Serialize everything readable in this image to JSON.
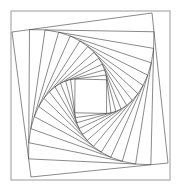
{
  "figure": {
    "type": "geometric-line-figure",
    "canvas": {
      "width": 181,
      "height": 194,
      "background": "#ffffff"
    },
    "frame": {
      "name": "outer-border-rectangle",
      "x": 11,
      "y": 11,
      "width": 159,
      "height": 169,
      "stroke": "#9a9a9a",
      "stroke_width": 1,
      "fill": "none"
    },
    "spiral": {
      "name": "whirling-squares",
      "construction": "each successive quadrilateral places its vertices at a constant fraction t along each edge of the previous quadrilateral, producing progressive rotation and shrinkage",
      "seed_quad": [
        [
          12,
          32
        ],
        [
          152,
          13
        ],
        [
          168,
          163
        ],
        [
          31,
          177
        ]
      ],
      "t_fraction": 0.125,
      "iterations": 13,
      "stroke": "#3a3a3a",
      "stroke_width": 0.6,
      "fill": "none",
      "rotation_direction": "clockwise-inward"
    }
  },
  "chart_data": {
    "type": "line",
    "xlabel": "",
    "ylabel": "",
    "xlim": [
      0,
      181
    ],
    "ylim": [
      0,
      194
    ],
    "grid": false,
    "legend": "none",
    "annotations": [],
    "series": [
      {
        "name": "outer-frame",
        "closed": true,
        "points": [
          [
            11,
            11
          ],
          [
            170,
            11
          ],
          [
            170,
            180
          ],
          [
            11,
            180
          ]
        ]
      },
      {
        "name": "quad-0",
        "closed": true,
        "points": [
          [
            12,
            32
          ],
          [
            152,
            13
          ],
          [
            168,
            163
          ],
          [
            31,
            177
          ]
        ]
      }
    ]
  }
}
